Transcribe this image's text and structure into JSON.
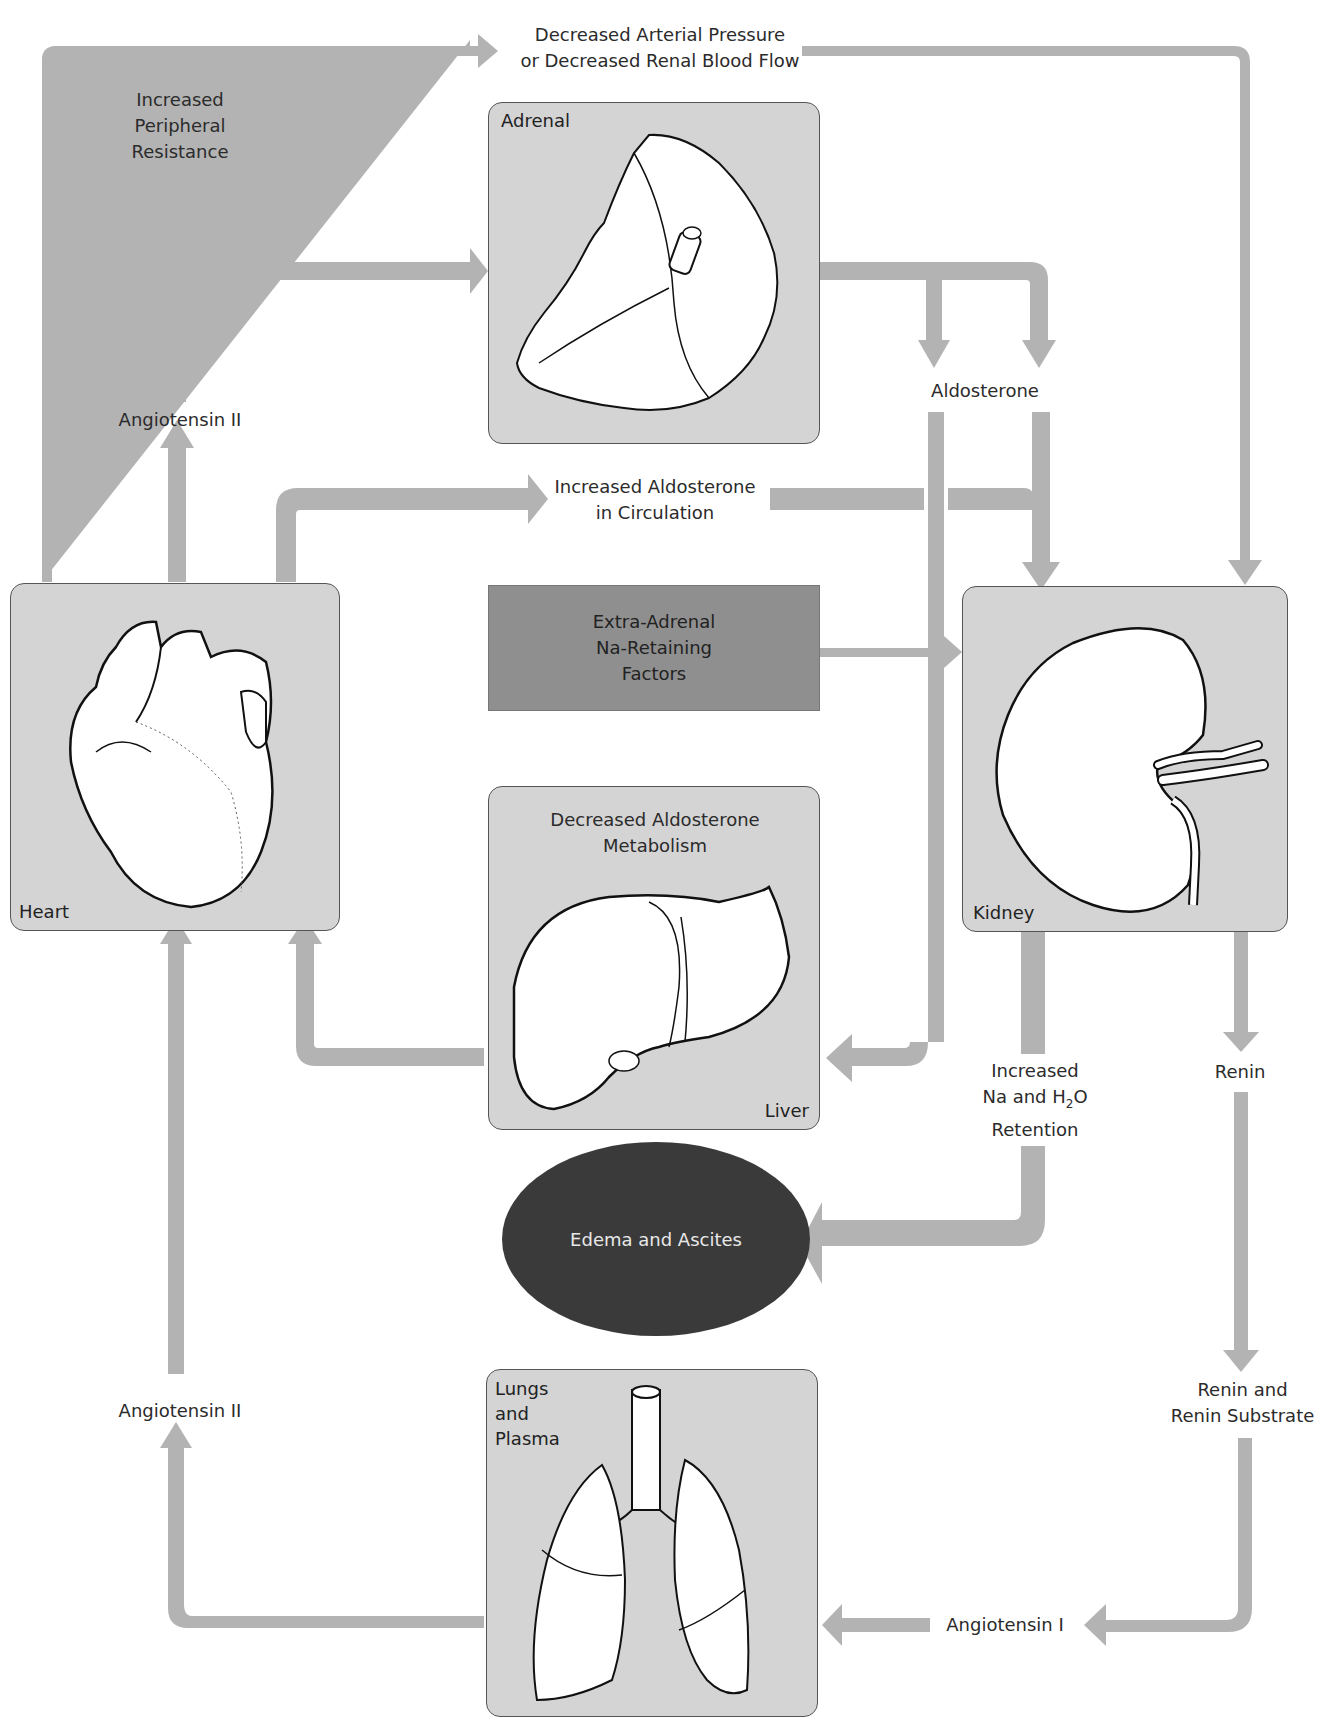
{
  "colors": {
    "arrow": "#b3b3b3",
    "panel": "#d4d4d4",
    "dark_box": "#8f8f8f",
    "ellipse": "#3a3a3a"
  },
  "organs": {
    "adrenal": {
      "label": "Adrenal"
    },
    "heart": {
      "label": "Heart"
    },
    "kidney": {
      "label": "Kidney"
    },
    "liver": {
      "label": "Liver",
      "caption_line1": "Decreased  Aldosterone",
      "caption_line2": "Metabolism"
    },
    "lungs": {
      "label_line1": "Lungs",
      "label_line2": "and",
      "label_line3": "Plasma"
    }
  },
  "nodes": {
    "decreased_pressure": {
      "line1": "Decreased Arterial Pressure",
      "line2": "or Decreased Renal Blood Flow"
    },
    "peripheral_resistance": {
      "line1": "Increased",
      "line2": "Peripheral",
      "line3": "Resistance"
    },
    "angiotensin_ii_top": "Angiotensin II",
    "aldosterone": "Aldosterone",
    "increased_aldosterone": {
      "line1": "Increased Aldosterone",
      "line2": "in Circulation"
    },
    "extra_adrenal": {
      "line1": "Extra-Adrenal",
      "line2": "Na-Retaining",
      "line3": "Factors"
    },
    "na_h2o_retention": {
      "line1": "Increased",
      "line2_pre": "Na and H",
      "line2_sub": "2",
      "line2_post": "O",
      "line3": "Retention"
    },
    "renin": "Renin",
    "edema_ascites": "Edema and Ascites",
    "renin_substrate": {
      "line1": "Renin and",
      "line2": "Renin Substrate"
    },
    "angiotensin_ii_bottom": "Angiotensin II",
    "angiotensin_i": "Angiotensin I"
  }
}
